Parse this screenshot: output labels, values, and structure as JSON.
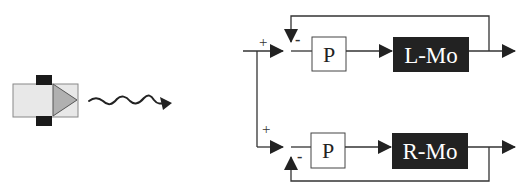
{
  "robot": {
    "body_color": "#e8e8e8",
    "wheel_color": "#1a1a1a",
    "nose_color": "#b0b0b0"
  },
  "motion_arrow": {
    "icon": "wavy-arrow-icon"
  },
  "top_loop": {
    "plus_sign": "+",
    "minus_sign": "-",
    "controller_label": "P",
    "motor_label": "L-Mo"
  },
  "bottom_loop": {
    "plus_sign": "+",
    "minus_sign": "-",
    "controller_label": "P",
    "motor_label": "R-Mo"
  },
  "colors": {
    "line": "#333333",
    "motor_fill": "#222222",
    "motor_text": "#ffffff",
    "controller_fill": "#ffffff"
  }
}
